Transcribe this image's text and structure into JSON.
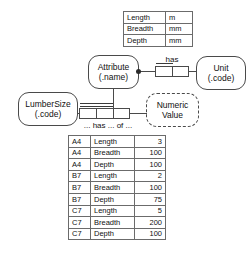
{
  "diagram": {
    "type": "orm-fact-type-diagram",
    "object_types": {
      "attribute": {
        "name": "Attribute",
        "ref_mode": "(.name)",
        "kind": "entity"
      },
      "unit": {
        "name": "Unit",
        "ref_mode": "(.code)",
        "kind": "entity"
      },
      "lumber_size": {
        "name": "LumberSize",
        "ref_mode": "(.code)",
        "kind": "entity"
      },
      "numeric_value": {
        "line1": "Numeric",
        "line2": "Value",
        "kind": "value-type",
        "border": "dashed"
      }
    },
    "predicates": {
      "has": {
        "reading": "has",
        "arity": 2,
        "roles": 2,
        "uniqueness": "first-role"
      },
      "ternary": {
        "reading": "... has ... of ...",
        "arity": 3,
        "roles": 3,
        "uniqueness": "first-two-roles"
      }
    },
    "constraints": {
      "mandatory_dot": "attribute-plays-has-role"
    }
  },
  "unit_table": {
    "caption": "",
    "rows": [
      {
        "attribute": "Length",
        "unit": "m"
      },
      {
        "attribute": "Breadth",
        "unit": "mm"
      },
      {
        "attribute": "Depth",
        "unit": "mm"
      }
    ]
  },
  "population_table": {
    "caption": "",
    "rows": [
      {
        "size": "A4",
        "attribute": "Length",
        "value": "3"
      },
      {
        "size": "A4",
        "attribute": "Breadth",
        "value": "100"
      },
      {
        "size": "A4",
        "attribute": "Depth",
        "value": "100"
      },
      {
        "size": "B7",
        "attribute": "Length",
        "value": "2"
      },
      {
        "size": "B7",
        "attribute": "Breadth",
        "value": "100"
      },
      {
        "size": "B7",
        "attribute": "Depth",
        "value": "75"
      },
      {
        "size": "C7",
        "attribute": "Length",
        "value": "5"
      },
      {
        "size": "C7",
        "attribute": "Breadth",
        "value": "200"
      },
      {
        "size": "C7",
        "attribute": "Depth",
        "value": "100"
      }
    ]
  },
  "colors": {
    "stroke": "#4a4a4a",
    "table_border": "#6b6b6b",
    "text": "#111111",
    "background": "#ffffff"
  }
}
